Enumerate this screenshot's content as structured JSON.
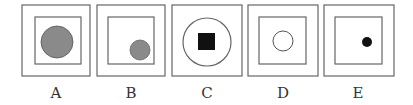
{
  "figure": {
    "options": [
      {
        "label": "A",
        "outer": {
          "x": 22,
          "y": 5,
          "w": 68,
          "h": 71
        },
        "inner": {
          "type": "square",
          "x": 35,
          "y": 17,
          "w": 46,
          "h": 47
        },
        "shape": {
          "type": "circle",
          "cx": 57,
          "cy": 42,
          "r": 16,
          "fill": "#8a8a8a",
          "stroke": "#555555"
        }
      },
      {
        "label": "B",
        "outer": {
          "x": 97,
          "y": 5,
          "w": 68,
          "h": 71
        },
        "inner": {
          "type": "square",
          "x": 108,
          "y": 17,
          "w": 46,
          "h": 47
        },
        "shape": {
          "type": "circle",
          "cx": 140,
          "cy": 50,
          "r": 10,
          "fill": "#8a8a8a",
          "stroke": "#666666"
        }
      },
      {
        "label": "C",
        "outer": {
          "x": 172,
          "y": 5,
          "w": 70,
          "h": 71
        },
        "inner": {
          "type": "circle",
          "cx": 207,
          "cy": 42,
          "r": 24
        },
        "shape": {
          "type": "square",
          "x": 198,
          "y": 33,
          "w": 17,
          "h": 17,
          "fill": "#111111"
        }
      },
      {
        "label": "D",
        "outer": {
          "x": 248,
          "y": 5,
          "w": 70,
          "h": 71
        },
        "inner": {
          "type": "square",
          "x": 259,
          "y": 17,
          "w": 47,
          "h": 47
        },
        "shape": {
          "type": "circle",
          "cx": 283,
          "cy": 41,
          "r": 10,
          "fill": "#ffffff",
          "stroke": "#555555"
        }
      },
      {
        "label": "E",
        "outer": {
          "x": 324,
          "y": 5,
          "w": 70,
          "h": 71
        },
        "inner": {
          "type": "square",
          "x": 335,
          "y": 17,
          "w": 47,
          "h": 47
        },
        "shape": {
          "type": "circle",
          "cx": 367,
          "cy": 42,
          "r": 5,
          "fill": "#111111",
          "stroke": "#111111"
        }
      }
    ],
    "colors": {
      "line": "#666666",
      "background": "#ffffff"
    }
  }
}
